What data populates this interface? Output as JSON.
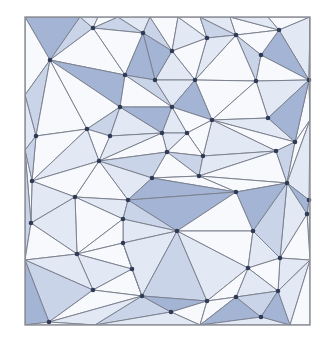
{
  "diagram": {
    "type": "triangulation-mesh",
    "frame": {
      "x": 25,
      "y": 17,
      "w": 285,
      "h": 308
    },
    "colors": {
      "dark": "#a3b4d5",
      "mid": "#c9d4e8",
      "light": "#e3e9f4",
      "white": "#f8f9fc",
      "edge": "#7d8290",
      "vertex": "#2f3a57",
      "frame": "#8a8d94"
    },
    "points": [
      [
        25,
        17
      ],
      [
        80,
        17
      ],
      [
        98,
        17
      ],
      [
        118,
        17
      ],
      [
        150,
        17
      ],
      [
        178,
        17
      ],
      [
        200,
        17
      ],
      [
        230,
        17
      ],
      [
        268,
        17
      ],
      [
        310,
        17
      ],
      [
        50,
        60
      ],
      [
        93,
        28
      ],
      [
        125,
        75
      ],
      [
        143,
        33
      ],
      [
        172,
        51
      ],
      [
        207,
        38
      ],
      [
        236,
        35
      ],
      [
        279,
        30
      ],
      [
        261,
        55
      ],
      [
        256,
        81
      ],
      [
        309,
        80
      ],
      [
        155,
        80
      ],
      [
        195,
        80
      ],
      [
        120,
        107
      ],
      [
        172,
        107
      ],
      [
        212,
        120
      ],
      [
        268,
        118
      ],
      [
        162,
        133
      ],
      [
        187,
        133
      ],
      [
        36,
        136
      ],
      [
        87,
        129
      ],
      [
        110,
        136
      ],
      [
        99,
        161
      ],
      [
        32,
        181
      ],
      [
        75,
        197
      ],
      [
        167,
        152
      ],
      [
        203,
        156
      ],
      [
        152,
        178
      ],
      [
        199,
        176
      ],
      [
        128,
        200
      ],
      [
        295,
        142
      ],
      [
        276,
        151
      ],
      [
        236,
        192
      ],
      [
        287,
        183
      ],
      [
        309,
        200
      ],
      [
        31,
        223
      ],
      [
        77,
        254
      ],
      [
        123,
        219
      ],
      [
        93,
        290
      ],
      [
        132,
        269
      ],
      [
        49,
        322
      ],
      [
        177,
        231
      ],
      [
        123,
        243
      ],
      [
        142,
        296
      ],
      [
        171,
        312
      ],
      [
        207,
        301
      ],
      [
        253,
        231
      ],
      [
        280,
        258
      ],
      [
        248,
        268
      ],
      [
        236,
        297
      ],
      [
        278,
        291
      ],
      [
        261,
        317
      ],
      [
        307,
        214
      ],
      [
        25,
        325
      ],
      [
        310,
        325
      ],
      [
        25,
        95
      ],
      [
        25,
        150
      ],
      [
        25,
        260
      ],
      [
        310,
        120
      ],
      [
        310,
        260
      ],
      [
        95,
        325
      ],
      [
        200,
        325
      ],
      [
        290,
        325
      ]
    ],
    "triangles": [
      [
        0,
        1,
        10,
        "dark"
      ],
      [
        1,
        11,
        10,
        "mid"
      ],
      [
        1,
        2,
        11,
        "light"
      ],
      [
        2,
        3,
        11,
        "white"
      ],
      [
        3,
        13,
        11,
        "mid"
      ],
      [
        11,
        13,
        12,
        "white"
      ],
      [
        10,
        11,
        12,
        "white"
      ],
      [
        3,
        4,
        13,
        "light"
      ],
      [
        4,
        14,
        13,
        "mid"
      ],
      [
        4,
        5,
        14,
        "white"
      ],
      [
        5,
        15,
        14,
        "light"
      ],
      [
        5,
        6,
        15,
        "white"
      ],
      [
        6,
        16,
        15,
        "mid"
      ],
      [
        6,
        7,
        16,
        "light"
      ],
      [
        7,
        17,
        16,
        "white"
      ],
      [
        7,
        8,
        17,
        "light"
      ],
      [
        8,
        9,
        17,
        "white"
      ],
      [
        9,
        20,
        17,
        "light"
      ],
      [
        17,
        20,
        18,
        "dark"
      ],
      [
        17,
        18,
        16,
        "white"
      ],
      [
        16,
        18,
        19,
        "mid"
      ],
      [
        16,
        19,
        22,
        "white"
      ],
      [
        15,
        16,
        22,
        "light"
      ],
      [
        15,
        22,
        14,
        "white"
      ],
      [
        14,
        22,
        21,
        "light"
      ],
      [
        13,
        14,
        21,
        "dark"
      ],
      [
        13,
        21,
        12,
        "dark"
      ],
      [
        12,
        21,
        24,
        "mid"
      ],
      [
        21,
        22,
        24,
        "light"
      ],
      [
        22,
        19,
        25,
        "white"
      ],
      [
        22,
        25,
        24,
        "dark"
      ],
      [
        18,
        20,
        19,
        "white"
      ],
      [
        19,
        20,
        26,
        "light"
      ],
      [
        19,
        26,
        25,
        "white"
      ],
      [
        10,
        12,
        23,
        "dark"
      ],
      [
        0,
        10,
        65,
        "white"
      ],
      [
        10,
        65,
        29,
        "mid"
      ],
      [
        10,
        29,
        30,
        "white"
      ],
      [
        10,
        30,
        23,
        "white"
      ],
      [
        23,
        30,
        31,
        "mid"
      ],
      [
        23,
        31,
        27,
        "light"
      ],
      [
        12,
        23,
        24,
        "white"
      ],
      [
        23,
        24,
        27,
        "dark"
      ],
      [
        24,
        28,
        27,
        "light"
      ],
      [
        24,
        25,
        28,
        "white"
      ],
      [
        25,
        26,
        40,
        "light"
      ],
      [
        25,
        40,
        41,
        "white"
      ],
      [
        25,
        41,
        36,
        "light"
      ],
      [
        25,
        36,
        28,
        "white"
      ],
      [
        28,
        36,
        35,
        "white"
      ],
      [
        27,
        28,
        35,
        "light"
      ],
      [
        20,
        68,
        40,
        "white"
      ],
      [
        20,
        40,
        26,
        "dark"
      ],
      [
        65,
        29,
        66,
        "light"
      ],
      [
        29,
        30,
        33,
        "white"
      ],
      [
        29,
        33,
        66,
        "mid"
      ],
      [
        30,
        31,
        32,
        "white"
      ],
      [
        30,
        32,
        33,
        "light"
      ],
      [
        31,
        27,
        32,
        "light"
      ],
      [
        32,
        27,
        35,
        "white"
      ],
      [
        32,
        35,
        37,
        "mid"
      ],
      [
        32,
        37,
        39,
        "light"
      ],
      [
        32,
        39,
        34,
        "white"
      ],
      [
        32,
        34,
        33,
        "white"
      ],
      [
        35,
        36,
        38,
        "mid"
      ],
      [
        35,
        38,
        37,
        "white"
      ],
      [
        36,
        41,
        38,
        "light"
      ],
      [
        41,
        43,
        38,
        "white"
      ],
      [
        40,
        43,
        41,
        "mid"
      ],
      [
        40,
        68,
        43,
        "white"
      ],
      [
        43,
        68,
        44,
        "light"
      ],
      [
        38,
        43,
        42,
        "white"
      ],
      [
        37,
        38,
        42,
        "white"
      ],
      [
        37,
        42,
        39,
        "dark"
      ],
      [
        33,
        34,
        45,
        "light"
      ],
      [
        33,
        45,
        66,
        "white"
      ],
      [
        66,
        45,
        67,
        "mid"
      ],
      [
        34,
        39,
        47,
        "light"
      ],
      [
        34,
        47,
        46,
        "white"
      ],
      [
        34,
        46,
        45,
        "light"
      ],
      [
        45,
        46,
        67,
        "white"
      ],
      [
        39,
        42,
        51,
        "dark"
      ],
      [
        39,
        51,
        47,
        "mid"
      ],
      [
        42,
        43,
        56,
        "dark"
      ],
      [
        42,
        56,
        51,
        "white"
      ],
      [
        43,
        44,
        62,
        "dark"
      ],
      [
        43,
        62,
        57,
        "light"
      ],
      [
        43,
        57,
        56,
        "mid"
      ],
      [
        44,
        69,
        62,
        "white"
      ],
      [
        47,
        51,
        52,
        "light"
      ],
      [
        47,
        52,
        46,
        "white"
      ],
      [
        46,
        52,
        49,
        "white"
      ],
      [
        46,
        49,
        48,
        "light"
      ],
      [
        46,
        48,
        67,
        "light"
      ],
      [
        67,
        48,
        50,
        "mid"
      ],
      [
        67,
        50,
        63,
        "dark"
      ],
      [
        48,
        49,
        53,
        "white"
      ],
      [
        49,
        52,
        53,
        "white"
      ],
      [
        52,
        51,
        53,
        "light"
      ],
      [
        51,
        55,
        53,
        "mid"
      ],
      [
        51,
        56,
        58,
        "white"
      ],
      [
        51,
        58,
        55,
        "light"
      ],
      [
        56,
        57,
        58,
        "light"
      ],
      [
        57,
        62,
        69,
        "white"
      ],
      [
        57,
        69,
        60,
        "light"
      ],
      [
        57,
        60,
        58,
        "white"
      ],
      [
        58,
        60,
        59,
        "light"
      ],
      [
        58,
        59,
        55,
        "white"
      ],
      [
        48,
        53,
        50,
        "white"
      ],
      [
        50,
        53,
        70,
        "light"
      ],
      [
        50,
        70,
        63,
        "white"
      ],
      [
        53,
        54,
        70,
        "mid"
      ],
      [
        53,
        55,
        54,
        "dark"
      ],
      [
        54,
        55,
        71,
        "white"
      ],
      [
        54,
        71,
        70,
        "light"
      ],
      [
        55,
        59,
        71,
        "white"
      ],
      [
        59,
        61,
        71,
        "dark"
      ],
      [
        59,
        60,
        61,
        "mid"
      ],
      [
        60,
        72,
        61,
        "dark"
      ],
      [
        60,
        69,
        72,
        "light"
      ],
      [
        69,
        64,
        72,
        "white"
      ],
      [
        61,
        72,
        71,
        "light"
      ],
      [
        9,
        68,
        20,
        "white"
      ]
    ]
  }
}
